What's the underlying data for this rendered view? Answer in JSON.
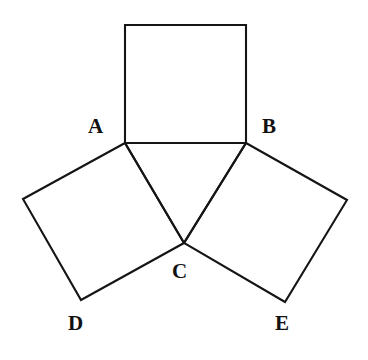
{
  "figure": {
    "background_color": "#ffffff",
    "stroke_color": "#151515",
    "stroke_width": 2.1,
    "canvas": {
      "width": 368,
      "height": 360
    }
  },
  "points": {
    "A": {
      "label": "A",
      "x": 125,
      "y": 143,
      "label_x": 88,
      "label_y": 116
    },
    "B": {
      "label": "B",
      "x": 246,
      "y": 143,
      "label_x": 262,
      "label_y": 116
    },
    "C": {
      "label": "C",
      "x": 184,
      "y": 243,
      "label_x": 172,
      "label_y": 261
    },
    "D": {
      "label": "D",
      "x": 81,
      "y": 300,
      "label_x": 68,
      "label_y": 313
    },
    "E": {
      "label": "E",
      "x": 285,
      "y": 302,
      "label_x": 275,
      "label_y": 313
    },
    "P": {
      "label": "",
      "x": 125,
      "y": 25
    },
    "Q": {
      "label": "",
      "x": 246,
      "y": 25
    },
    "F": {
      "label": "",
      "x": 23,
      "y": 199
    },
    "G": {
      "label": "",
      "x": 347,
      "y": 200
    }
  },
  "shapes": {
    "square_top": {
      "name": "square-ABQP",
      "points": "125,25 246,25 246,143 125,143"
    },
    "square_left": {
      "name": "square-ACDF",
      "points": "125,143 23,199 81,300 184,243"
    },
    "square_right": {
      "name": "square-BGEC",
      "points": "246,143 347,200 285,302 184,243"
    }
  },
  "segments": {
    "AC": {
      "name": "segment-AC",
      "x1": 125,
      "y1": 143,
      "x2": 184,
      "y2": 243
    },
    "BC": {
      "name": "segment-BC",
      "x1": 246,
      "y1": 143,
      "x2": 184,
      "y2": 243
    },
    "AB": {
      "name": "segment-AB",
      "x1": 125,
      "y1": 143,
      "x2": 246,
      "y2": 143
    }
  }
}
